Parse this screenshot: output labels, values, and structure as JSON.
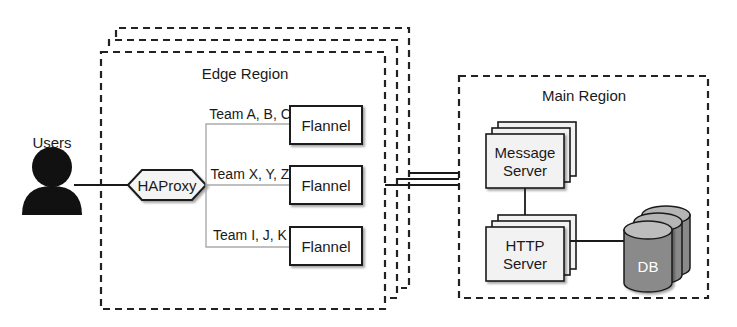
{
  "diagram": {
    "users": {
      "label": "Users",
      "icon": "user-silhouette-icon"
    },
    "proxy": {
      "label": "HAProxy"
    },
    "edge_region": {
      "title": "Edge Region",
      "stack_count": 3,
      "routes": [
        {
          "team_label": "Team A, B, C",
          "node_label": "Flannel"
        },
        {
          "team_label": "Team X, Y, Z",
          "node_label": "Flannel"
        },
        {
          "team_label": "Team I, J, K",
          "node_label": "Flannel"
        }
      ]
    },
    "main_region": {
      "title": "Main Region",
      "message_server": {
        "line1": "Message",
        "line2": "Server"
      },
      "http_server": {
        "line1": "HTTP",
        "line2": "Server"
      },
      "db": {
        "label": "DB"
      }
    },
    "colors": {
      "stroke": "#1a1a1a",
      "server_fill": "#f2f2f2",
      "db_top": "#b5b5b5",
      "db_body": "#8a8a8a",
      "branch_line": "#aaaaaa"
    }
  }
}
